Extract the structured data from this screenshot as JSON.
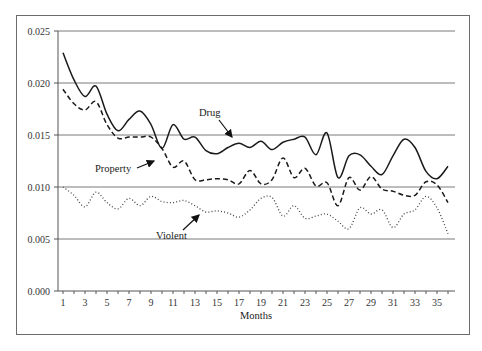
{
  "chart_data": {
    "type": "line",
    "title": "",
    "xlabel": "Months",
    "ylabel": "",
    "ylim": [
      0,
      0.025
    ],
    "xlim": [
      1,
      36
    ],
    "grid": "horizontal",
    "legend": "inline annotations with arrows",
    "y_ticks": [
      "0.000",
      "0.005",
      "0.010",
      "0.015",
      "0.020",
      "0.025"
    ],
    "y_tick_values": [
      0,
      0.005,
      0.01,
      0.015,
      0.02,
      0.025
    ],
    "x_tick_labels": [
      "1",
      "3",
      "5",
      "7",
      "9",
      "11",
      "13",
      "15",
      "17",
      "19",
      "21",
      "23",
      "25",
      "27",
      "29",
      "31",
      "33",
      "35"
    ],
    "x": [
      1,
      2,
      3,
      4,
      5,
      6,
      7,
      8,
      9,
      10,
      11,
      12,
      13,
      14,
      15,
      16,
      17,
      18,
      19,
      20,
      21,
      22,
      23,
      24,
      25,
      26,
      27,
      28,
      29,
      30,
      31,
      32,
      33,
      34,
      35,
      36
    ],
    "series": [
      {
        "name": "Drug",
        "style": "solid",
        "color": "#1a1a1a",
        "values": [
          0.0229,
          0.0203,
          0.0187,
          0.0197,
          0.017,
          0.0154,
          0.0165,
          0.0173,
          0.016,
          0.0137,
          0.016,
          0.0146,
          0.0148,
          0.0135,
          0.0132,
          0.0138,
          0.0142,
          0.0138,
          0.0144,
          0.0136,
          0.0143,
          0.0146,
          0.0148,
          0.0131,
          0.0152,
          0.0109,
          0.013,
          0.0131,
          0.012,
          0.0112,
          0.013,
          0.0146,
          0.0138,
          0.0115,
          0.0108,
          0.012
        ]
      },
      {
        "name": "Property",
        "style": "dashed",
        "color": "#1a1a1a",
        "values": [
          0.0194,
          0.018,
          0.0174,
          0.0182,
          0.016,
          0.0147,
          0.0148,
          0.0148,
          0.0148,
          0.0137,
          0.0119,
          0.0125,
          0.0107,
          0.0107,
          0.0108,
          0.0107,
          0.0103,
          0.0116,
          0.0103,
          0.0107,
          0.0128,
          0.0109,
          0.0118,
          0.0101,
          0.0104,
          0.0082,
          0.0109,
          0.0097,
          0.011,
          0.0098,
          0.0096,
          0.0092,
          0.0092,
          0.0105,
          0.0102,
          0.0085
        ]
      },
      {
        "name": "Violent",
        "style": "dotted",
        "color": "#444444",
        "values": [
          0.01,
          0.0092,
          0.0081,
          0.0095,
          0.0085,
          0.0079,
          0.0089,
          0.0082,
          0.0091,
          0.0086,
          0.0085,
          0.0087,
          0.0082,
          0.0076,
          0.0077,
          0.0075,
          0.0071,
          0.0078,
          0.0089,
          0.009,
          0.0072,
          0.0082,
          0.007,
          0.0072,
          0.0074,
          0.0067,
          0.006,
          0.008,
          0.0074,
          0.0078,
          0.0061,
          0.0074,
          0.0078,
          0.0091,
          0.008,
          0.0055
        ]
      }
    ],
    "annotations": [
      {
        "text": "Drug",
        "label_x": 199,
        "label_y": 116,
        "arrow_from": [
          219,
          120
        ],
        "arrow_to": [
          232,
          137
        ]
      },
      {
        "text": "Property",
        "label_x": 95,
        "label_y": 172,
        "arrow_from": [
          137,
          168
        ],
        "arrow_to": [
          154,
          161
        ]
      },
      {
        "text": "Violent",
        "label_x": 156,
        "label_y": 239,
        "arrow_from": [
          183,
          230
        ],
        "arrow_to": [
          199,
          215
        ]
      }
    ]
  }
}
